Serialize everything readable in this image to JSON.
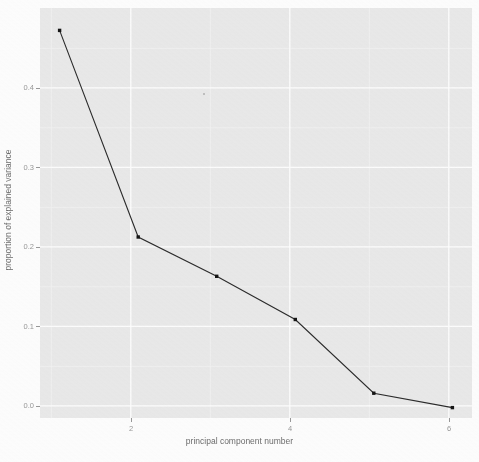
{
  "chart_data": {
    "type": "line",
    "title": "",
    "subtitle": "",
    "xlabel": "principal component number",
    "ylabel": "proportion of explained variance",
    "x": [
      1,
      2,
      3,
      4,
      5,
      6
    ],
    "values": [
      0.472,
      0.214,
      0.165,
      0.111,
      0.019,
      0.001
    ],
    "series": [
      {
        "name": "proportion of explained variance",
        "values": [
          0.472,
          0.214,
          0.165,
          0.111,
          0.019,
          0.001
        ]
      }
    ],
    "xlim": [
      0.75,
      6.25
    ],
    "ylim": [
      -0.012,
      0.5
    ],
    "xticks": [
      2,
      4,
      6
    ],
    "xtick_labels": [
      "2",
      "4",
      "6"
    ],
    "yticks": [
      0.0,
      0.1,
      0.2,
      0.3,
      0.4
    ],
    "ytick_labels": [
      "0.0",
      "0.1",
      "0.2",
      "0.3",
      "0.4"
    ],
    "grid": true,
    "grid_major_color": "#ffffff",
    "grid_minor_color": "#f5f5f5",
    "legend": null,
    "legend_position": "none",
    "marker": "point",
    "line_color": "#2b2b2b",
    "point_color": "#1a1a1a",
    "panel_background": "#ebebeb",
    "plot_background": "#ffffff",
    "axis_text_color": "#9a9a9a",
    "axis_title_color": "#6e6e6e",
    "annotations": []
  },
  "figure": {
    "xlabel": "principal component number",
    "ylabel": "proportion of explained variance",
    "xtick_labels": [
      "2",
      "4",
      "6"
    ],
    "ytick_labels": [
      "0.0",
      "0.1",
      "0.2",
      "0.3",
      "0.4"
    ]
  }
}
